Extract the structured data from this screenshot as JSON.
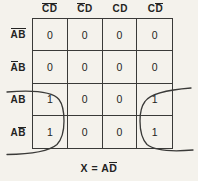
{
  "figure": {
    "type": "karnaugh-map",
    "notation": "~ prefixes a letter drawn with an overbar (logical complement)",
    "col_headers": [
      "~C~D",
      "~CD",
      "CD",
      "C~D"
    ],
    "row_headers": [
      "~A~B",
      "~AB",
      "AB",
      "A~B"
    ],
    "cells": [
      [
        "0",
        "0",
        "0",
        "0"
      ],
      [
        "0",
        "0",
        "0",
        "0"
      ],
      [
        "1",
        "0",
        "0",
        "1"
      ],
      [
        "1",
        "0",
        "0",
        "1"
      ]
    ],
    "loops": [
      "wrap-group-column-CbarDbar-rows-AB-ABbar",
      "wrap-group-column-CDbar-rows-AB-ABbar"
    ],
    "caption": "X = A~D",
    "colors": {
      "background": "#f4f2ec",
      "line": "#3a3a38",
      "text": "#232322"
    }
  }
}
